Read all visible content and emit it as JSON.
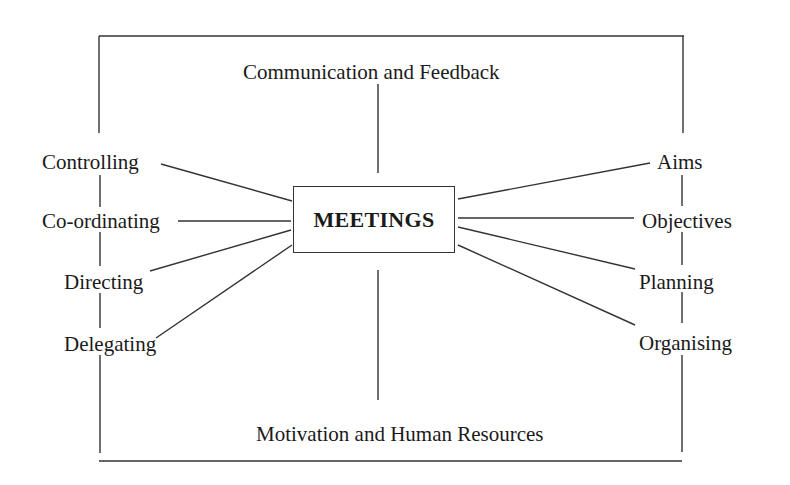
{
  "diagram": {
    "center": {
      "label": "MEETINGS"
    },
    "top": {
      "label": "Communication and Feedback"
    },
    "bottom": {
      "label": "Motivation and Human Resources"
    },
    "left": [
      {
        "label": "Controlling"
      },
      {
        "label": "Co-ordinating"
      },
      {
        "label": "Directing"
      },
      {
        "label": "Delegating"
      }
    ],
    "right": [
      {
        "label": "Aims"
      },
      {
        "label": "Objectives"
      },
      {
        "label": "Planning"
      },
      {
        "label": "Organising"
      }
    ],
    "colors": {
      "line": "#333333",
      "text": "#1a1a1a",
      "background": "#ffffff"
    }
  }
}
